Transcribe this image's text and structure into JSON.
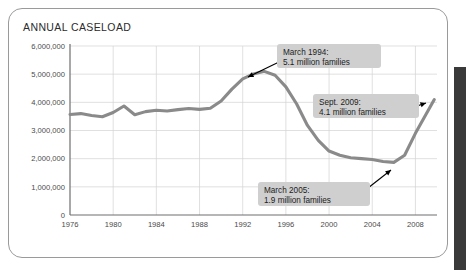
{
  "card": {
    "title": "ANNUAL CASELOAD"
  },
  "scrollbar": {
    "name": "vertical-scrollbar"
  },
  "chart_data": {
    "type": "line",
    "title": "ANNUAL CASELOAD",
    "xlabel": "",
    "ylabel": "",
    "grid": true,
    "legend": "none",
    "xlim": [
      1976,
      2010
    ],
    "ylim": [
      0,
      6000000
    ],
    "ytick_labels": [
      "6,000,000",
      "5,000,000",
      "4,000,000",
      "3,000,000",
      "2,000,000",
      "1,000,000",
      "0"
    ],
    "ytick_values": [
      6000000,
      5000000,
      4000000,
      3000000,
      2000000,
      1000000,
      0
    ],
    "xtick_labels": [
      "1976",
      "1980",
      "1984",
      "1988",
      "1992",
      "1996",
      "2000",
      "2004",
      "2008"
    ],
    "xtick_values": [
      1976,
      1980,
      1984,
      1988,
      1992,
      1996,
      2000,
      2004,
      2008
    ],
    "series": [
      {
        "name": "Annual caseload (families)",
        "color": "#8a8a8a",
        "x": [
          1976,
          1977,
          1978,
          1979,
          1980,
          1981,
          1982,
          1983,
          1984,
          1985,
          1986,
          1987,
          1988,
          1989,
          1990,
          1991,
          1992,
          1993,
          1994,
          1995,
          1996,
          1997,
          1998,
          1999,
          2000,
          2001,
          2002,
          2003,
          2004,
          2005,
          2006,
          2007,
          2008,
          2009.75
        ],
        "values": [
          3570000,
          3600000,
          3530000,
          3490000,
          3640000,
          3870000,
          3560000,
          3670000,
          3720000,
          3690000,
          3740000,
          3780000,
          3750000,
          3790000,
          4050000,
          4470000,
          4830000,
          5010000,
          5100000,
          4960000,
          4550000,
          3940000,
          3180000,
          2650000,
          2270000,
          2120000,
          2030000,
          2000000,
          1970000,
          1900000,
          1870000,
          2120000,
          2900000,
          4100000
        ]
      }
    ],
    "annotations": [
      {
        "id": "peak-1994",
        "line1": "March 1994:",
        "line2": "5.1 million families",
        "point_year": 1994,
        "point_value": 5100000
      },
      {
        "id": "sept-2009",
        "line1": "Sept. 2009:",
        "line2": "4.1 million families",
        "point_year": 2009.75,
        "point_value": 4100000
      },
      {
        "id": "trough-2005",
        "line1": "March 2005:",
        "line2": "1.9 million families",
        "point_year": 2005,
        "point_value": 1900000
      }
    ]
  }
}
